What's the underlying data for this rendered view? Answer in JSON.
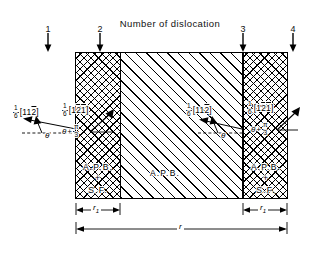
{
  "figure": {
    "title": "Number of dislocation",
    "dislocations": [
      {
        "id": "1",
        "label": "1"
      },
      {
        "id": "2",
        "label": "2"
      },
      {
        "id": "3",
        "label": "3"
      },
      {
        "id": "4",
        "label": "4"
      }
    ],
    "regions": {
      "left_band": {
        "label_line1": "A.P.B.",
        "label_line2": "+",
        "label_line3": "S.F."
      },
      "center": {
        "label": "A.P.B."
      },
      "right_band": {
        "label_line1": "A.P.B.",
        "label_line2": "+",
        "label_line3": "S.F."
      }
    },
    "burgers_vectors": {
      "outer_left": {
        "num": "1",
        "den": "6",
        "open": "[",
        "i1": "1",
        "i2": "1",
        "i3": "2",
        "i3_bar": true,
        "close": "]"
      },
      "inner_left": {
        "num": "1",
        "den": "6",
        "open": "[",
        "i1": "1",
        "i2": "2",
        "i2_bar": true,
        "i3": "1",
        "i3_bar": true,
        "close": "]"
      },
      "inner_right": {
        "num": "1",
        "den": "6",
        "open": "[",
        "i1": "1",
        "i2": "1",
        "i3": "2",
        "i3_bar": true,
        "close": "]"
      },
      "outer_right": {
        "num": "1",
        "den": "6",
        "open": "[",
        "i1": "1",
        "i2": "2",
        "i2_bar": true,
        "i3": "1",
        "i3_bar": true,
        "close": "]"
      }
    },
    "angles": {
      "theta": "θ",
      "theta_plus": "θ",
      "plus_sign": "+",
      "pi": "π",
      "three": "3"
    },
    "dimensions": {
      "left": "r",
      "left_sub": "1",
      "right": "r",
      "right_sub": "1",
      "total": "r"
    }
  },
  "colors": {
    "ink": "#000000",
    "paper": "#ffffff"
  }
}
